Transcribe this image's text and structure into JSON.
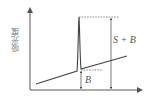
{
  "diagram": {
    "y_axis_label": "吸光度",
    "labels": {
      "signal_plus_background": "S + B",
      "background": "B"
    },
    "colors": {
      "line": "#444444",
      "axis": "#555555"
    }
  }
}
